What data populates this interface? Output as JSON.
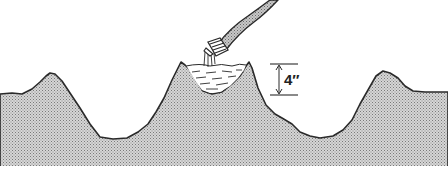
{
  "diagram": {
    "dimension": {
      "label": "4″",
      "meaning": "water depth in basin"
    },
    "elements": [
      "ground-profile",
      "hose",
      "water-basin",
      "water-stream",
      "depth-dimension"
    ],
    "colors": {
      "ground_fill": "#b8b8b8",
      "outline": "#2a2a2a",
      "background": "#ffffff",
      "water": "#ffffff"
    }
  }
}
